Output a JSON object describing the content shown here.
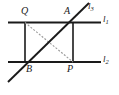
{
  "figure": {
    "kind": "plane-geometry-diagram",
    "width": 119,
    "height": 95,
    "background_color": "#ffffff",
    "stroke_color": "#1a1a1a",
    "dashed_stroke_color": "#9a9a9a"
  },
  "labels": {
    "Q": "Q",
    "A": "A",
    "B": "B",
    "P": "P",
    "l1_base": "l",
    "l1_sub": "1",
    "l2_base": "l",
    "l2_sub": "2",
    "l3_base": "l",
    "l3_sub": "3"
  },
  "points": {
    "Q": {
      "x": 25,
      "y": 22.5
    },
    "A": {
      "x": 73,
      "y": 22.5
    },
    "B": {
      "x": 25,
      "y": 62
    },
    "P": {
      "x": 73,
      "y": 62
    }
  },
  "segments": [
    {
      "name": "line-l1",
      "x1": 8,
      "y1": 22.5,
      "x2": 101,
      "y2": 22.5,
      "style": "solid",
      "width": 1.9
    },
    {
      "name": "line-l2",
      "x1": 8,
      "y1": 62,
      "x2": 101,
      "y2": 62,
      "style": "solid",
      "width": 1.9
    },
    {
      "name": "side-QB",
      "x1": 25,
      "y1": 22.5,
      "x2": 25,
      "y2": 62,
      "style": "solid",
      "width": 1.6
    },
    {
      "name": "side-AP",
      "x1": 73,
      "y1": 22.5,
      "x2": 73,
      "y2": 62,
      "style": "solid",
      "width": 1.6
    },
    {
      "name": "line-l3",
      "x1": 8,
      "y1": 82,
      "x2": 89,
      "y2": 3,
      "style": "solid",
      "width": 1.9
    },
    {
      "name": "diagonal-QP",
      "x1": 25,
      "y1": 22.5,
      "x2": 73,
      "y2": 62,
      "style": "dashed",
      "width": 1.1
    }
  ]
}
